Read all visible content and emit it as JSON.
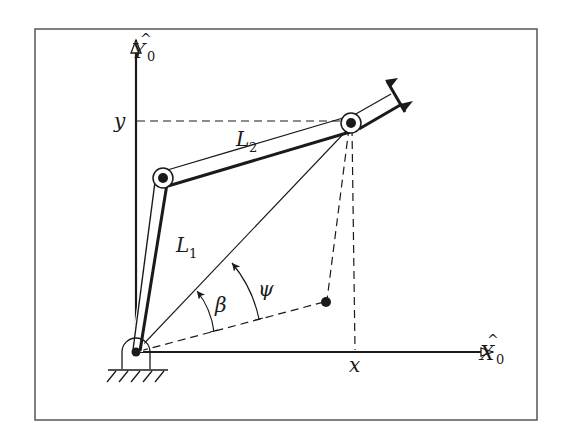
{
  "diagram": {
    "frame": {
      "x": 35,
      "y": 29,
      "width": 502,
      "height": 391,
      "stroke": "#555555"
    },
    "axes": {
      "x_axis": {
        "label": "X",
        "hat": "^",
        "subscript": "0"
      },
      "y_axis": {
        "label": "Y",
        "hat": "^",
        "subscript": "0"
      }
    },
    "coordinates": {
      "x_label": "x",
      "y_label": "y"
    },
    "links": [
      {
        "name": "L",
        "subscript": "1"
      },
      {
        "name": "L",
        "subscript": "2"
      }
    ],
    "angles": [
      {
        "symbol": "β"
      },
      {
        "symbol": "ψ"
      }
    ],
    "points": {
      "base": [
        136,
        352
      ],
      "elbow": [
        162,
        178
      ],
      "wrist": [
        350,
        123
      ],
      "target": [
        326,
        302
      ]
    },
    "colors": {
      "ink": "#1a1a1a",
      "background": "#ffffff"
    }
  }
}
